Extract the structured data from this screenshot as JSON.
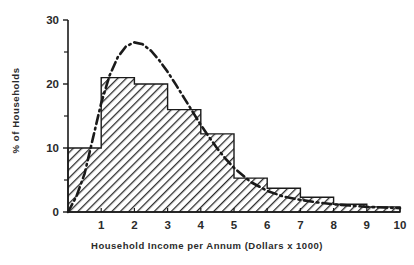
{
  "chart_data": {
    "type": "bar",
    "title": "",
    "subtitle": "",
    "xlabel": "Household Income per Annum (Dollars x 1000)",
    "ylabel": "% of Households",
    "xlim": [
      0,
      10
    ],
    "ylim": [
      0,
      30
    ],
    "grid": false,
    "legend": null,
    "x_ticks": [
      "1",
      "2",
      "3",
      "4",
      "5",
      "6",
      "7",
      "8",
      "9",
      "10"
    ],
    "x_tick_values": [
      1,
      2,
      3,
      4,
      5,
      6,
      7,
      8,
      9,
      10
    ],
    "y_ticks": [
      "0",
      "10",
      "20",
      "30"
    ],
    "y_tick_values": [
      0,
      10,
      20,
      30
    ],
    "y_minor_tick_values": [
      5,
      15,
      25
    ],
    "bin_width": 1,
    "categories": [
      "0-1",
      "1-2",
      "2-3",
      "3-4",
      "4-5",
      "5-6",
      "6-7",
      "7-8",
      "8-9",
      "9-10"
    ],
    "bin_edges": [
      0,
      1,
      2,
      3,
      4,
      5,
      6,
      7,
      8,
      9,
      10
    ],
    "values": [
      10.0,
      21.0,
      20.0,
      16.0,
      12.2,
      5.3,
      3.7,
      2.3,
      1.2,
      0.8
    ],
    "series": [
      {
        "name": "Histogram of households",
        "type": "bar",
        "fill": "diagonal-hatch",
        "values": [
          10.0,
          21.0,
          20.0,
          16.0,
          12.2,
          5.3,
          3.7,
          2.3,
          1.2,
          0.8
        ]
      },
      {
        "name": "Fitted distribution curve",
        "type": "line",
        "style": "dash-dot",
        "x": [
          0.0,
          0.25,
          0.5,
          0.75,
          1.0,
          1.25,
          1.5,
          1.75,
          2.0,
          2.25,
          2.5,
          2.75,
          3.0,
          3.25,
          3.5,
          3.75,
          4.0,
          4.25,
          4.5,
          4.75,
          5.0,
          5.5,
          6.0,
          6.5,
          7.0,
          7.5,
          8.0,
          8.5,
          9.0,
          9.5,
          10.0
        ],
        "y": [
          0.0,
          2.4,
          6.0,
          11.5,
          17.0,
          21.3,
          24.2,
          25.9,
          26.5,
          26.2,
          25.2,
          23.7,
          21.9,
          19.9,
          17.8,
          15.7,
          13.6,
          11.7,
          9.9,
          8.3,
          6.9,
          4.7,
          3.3,
          2.4,
          1.9,
          1.5,
          1.2,
          1.0,
          0.8,
          0.7,
          0.6
        ]
      }
    ],
    "colors": {
      "axis": "#1a1a1a",
      "bar_outline": "#1a1a1a",
      "bar_hatch": "#2b2b2b",
      "curve": "#1a1a1a",
      "background": "#ffffff",
      "text": "#2b2b2b"
    }
  },
  "axes": {
    "x_axis_label": "Household Income per Annum (Dollars x 1000)",
    "y_axis_label": "% of Households"
  }
}
